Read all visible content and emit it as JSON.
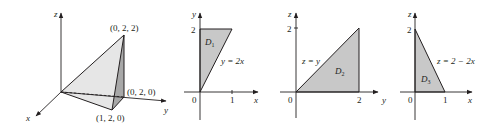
{
  "figure": {
    "panel_3d": {
      "axes": {
        "x": "x",
        "y": "y",
        "z": "z"
      },
      "vertices": {
        "apex": "(0, 2, 2)",
        "back": "(0, 2, 0)",
        "front": "(1, 2, 0)"
      },
      "colors": {
        "light_face": "#e6e6e6",
        "dark_face": "#a8a8a8"
      }
    },
    "panel_d1": {
      "axes": {
        "horizontal": "x",
        "vertical": "y"
      },
      "origin": "0",
      "y_tick": "2",
      "x_tick": "1",
      "region": "D",
      "region_sub": "1",
      "curve_label": "y = 2x",
      "fill": "#c8c8c8"
    },
    "panel_d2": {
      "axes": {
        "horizontal": "y",
        "vertical": "z"
      },
      "origin": "0",
      "v_tick": "2",
      "h_tick": "2",
      "region": "D",
      "region_sub": "2",
      "curve_label": "z = y",
      "fill": "#c8c8c8"
    },
    "panel_d3": {
      "axes": {
        "horizontal": "x",
        "vertical": "z"
      },
      "origin": "0",
      "v_tick": "2",
      "h_tick": "1",
      "region": "D",
      "region_sub": "3",
      "curve_label": "z = 2 − 2x",
      "fill": "#c8c8c8"
    }
  }
}
